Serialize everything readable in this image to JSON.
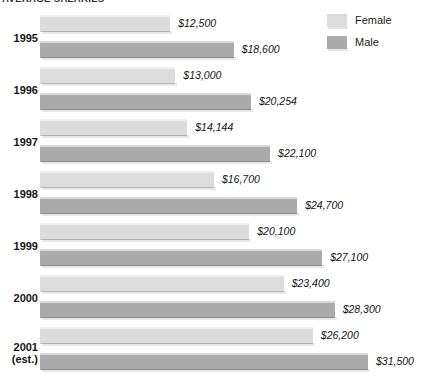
{
  "chart_data": {
    "type": "bar",
    "title": "AVERAGE SALARIES",
    "xlabel": "",
    "ylabel": "",
    "orientation": "horizontal",
    "grid": false,
    "legend_position": "top-right",
    "value_prefix": "$",
    "xlim": [
      0,
      31500
    ],
    "categories": [
      "1995",
      "1996",
      "1997",
      "1998",
      "1999",
      "2000",
      "2001"
    ],
    "category_notes": [
      "",
      "",
      "",
      "",
      "",
      "",
      "(est.)"
    ],
    "series": [
      {
        "name": "Female",
        "color": "#dcdcdc",
        "values": [
          12500,
          13000,
          14144,
          16700,
          20100,
          23400,
          26200
        ],
        "labels": [
          "$12,500",
          "$13,000",
          "$14,144",
          "$16,700",
          "$20,100",
          "$23,400",
          "$26,200"
        ]
      },
      {
        "name": "Male",
        "color": "#ababab",
        "values": [
          18600,
          20254,
          22100,
          24700,
          27100,
          28300,
          31500
        ],
        "labels": [
          "$18,600",
          "$20,254",
          "$22,100",
          "$24,700",
          "$27,100",
          "$28,300",
          "$31,500"
        ]
      }
    ]
  },
  "title": "AVERAGE SALARIES",
  "legend": {
    "female_label": "Female",
    "male_label": "Male"
  },
  "rows": [
    {
      "year": "1995",
      "note": "",
      "female_label": "$12,500",
      "male_label": "$18,600"
    },
    {
      "year": "1996",
      "note": "",
      "female_label": "$13,000",
      "male_label": "$20,254"
    },
    {
      "year": "1997",
      "note": "",
      "female_label": "$14,144",
      "male_label": "$22,100"
    },
    {
      "year": "1998",
      "note": "",
      "female_label": "$16,700",
      "male_label": "$24,700"
    },
    {
      "year": "1999",
      "note": "",
      "female_label": "$20,100",
      "male_label": "$27,100"
    },
    {
      "year": "2000",
      "note": "",
      "female_label": "$23,400",
      "male_label": "$28,300"
    },
    {
      "year": "2001",
      "note": "(est.)",
      "female_label": "$26,200",
      "male_label": "$31,500"
    }
  ]
}
